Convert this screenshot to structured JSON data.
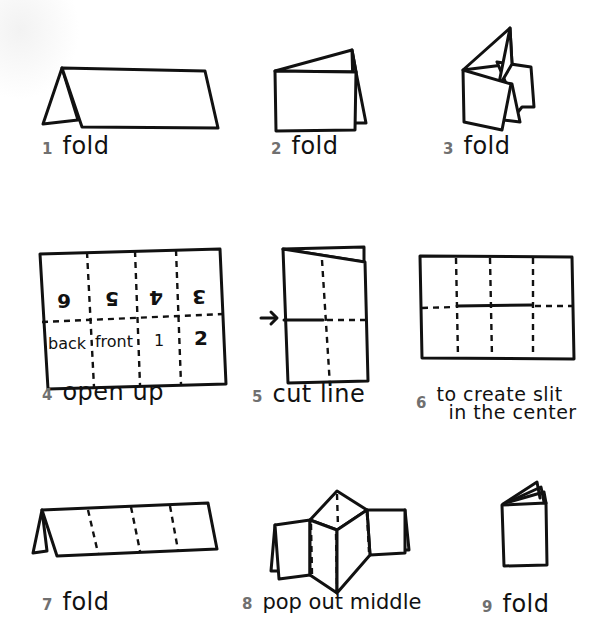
{
  "diagram": {
    "title": "",
    "steps": [
      {
        "number": "1",
        "label": "fold"
      },
      {
        "number": "2",
        "label": "fold"
      },
      {
        "number": "3",
        "label": "fold"
      },
      {
        "number": "4",
        "label": "open up"
      },
      {
        "number": "5",
        "label": "cut line"
      },
      {
        "number": "6",
        "label_line1": "to create slit",
        "label_line2": "in the center"
      },
      {
        "number": "7",
        "label": "fold"
      },
      {
        "number": "8",
        "label": "pop out middle"
      },
      {
        "number": "9",
        "label": "fold"
      }
    ],
    "grid_step4": {
      "top_row_upside_down": [
        "6",
        "5",
        "4",
        "3"
      ],
      "bottom_row": [
        "back",
        "front",
        "1",
        "2"
      ]
    },
    "colors": {
      "ink": "#111111",
      "step_number": "#707070",
      "background": "#ffffff"
    }
  }
}
